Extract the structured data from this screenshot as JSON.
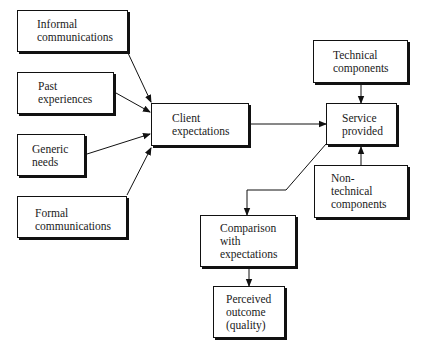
{
  "diagram": {
    "type": "flowchart",
    "nodes": [
      {
        "id": "informal",
        "label": "Informal\ncommunications",
        "box": [
          17,
          10,
          111,
          42
        ],
        "text_offset": [
          19,
          7
        ]
      },
      {
        "id": "past",
        "label": "Past\nexperiences",
        "box": [
          17,
          72,
          97,
          42
        ],
        "text_offset": [
          20,
          7
        ]
      },
      {
        "id": "generic",
        "label": "Generic\nneeds",
        "box": [
          17,
          134,
          68,
          42
        ],
        "text_offset": [
          14,
          8
        ]
      },
      {
        "id": "formal",
        "label": "Formal\ncommunications",
        "box": [
          17,
          196,
          110,
          42
        ],
        "text_offset": [
          17,
          10
        ]
      },
      {
        "id": "client",
        "label": "Client\nexpectations",
        "box": [
          151,
          103,
          98,
          43
        ],
        "text_offset": [
          20,
          8
        ]
      },
      {
        "id": "service",
        "label": "Service\nprovided",
        "box": [
          326,
          103,
          71,
          42
        ],
        "text_offset": [
          15,
          8
        ]
      },
      {
        "id": "technical",
        "label": "Technical\ncomponents",
        "box": [
          313,
          40,
          95,
          43
        ],
        "text_offset": [
          19,
          8
        ]
      },
      {
        "id": "nontechnical",
        "label": "Non-\ntechnical\ncomponents",
        "box": [
          314,
          165,
          94,
          53
        ],
        "text_offset": [
          16,
          6
        ]
      },
      {
        "id": "comparison",
        "label": "Comparison\nwith\nexpectations",
        "box": [
          200,
          215,
          96,
          52
        ],
        "text_offset": [
          19,
          6
        ]
      },
      {
        "id": "perceived",
        "label": "Perceived\noutcome\n(quality)",
        "box": [
          213,
          286,
          72,
          52
        ],
        "text_offset": [
          12,
          6
        ]
      }
    ],
    "edges": [
      {
        "from": "informal",
        "to": "client",
        "points": [
          [
            128,
            53
          ],
          [
            151,
            102
          ]
        ]
      },
      {
        "from": "past",
        "to": "client",
        "points": [
          [
            116,
            93
          ],
          [
            150,
            112
          ]
        ]
      },
      {
        "from": "generic",
        "to": "client",
        "points": [
          [
            87,
            154
          ],
          [
            150,
            134
          ]
        ]
      },
      {
        "from": "formal",
        "to": "client",
        "points": [
          [
            127,
            195
          ],
          [
            151,
            148
          ]
        ]
      },
      {
        "from": "client",
        "to": "service",
        "points": [
          [
            251,
            124
          ],
          [
            326,
            124
          ]
        ]
      },
      {
        "from": "technical",
        "to": "service",
        "points": [
          [
            361,
            85
          ],
          [
            361,
            103
          ]
        ]
      },
      {
        "from": "nontechnical",
        "to": "service",
        "points": [
          [
            361,
            165
          ],
          [
            361,
            147
          ]
        ]
      },
      {
        "from": "service",
        "to": "comparison",
        "points": [
          [
            326,
            144
          ],
          [
            286,
            190
          ],
          [
            247,
            190
          ],
          [
            247,
            215
          ]
        ]
      },
      {
        "from": "comparison",
        "to": "perceived",
        "points": [
          [
            249,
            269
          ],
          [
            249,
            286
          ]
        ]
      }
    ],
    "colors": {
      "line": "#111111",
      "box_fill": "#ffffff",
      "shadow": "#111111",
      "text": "#1a1a1a"
    }
  }
}
